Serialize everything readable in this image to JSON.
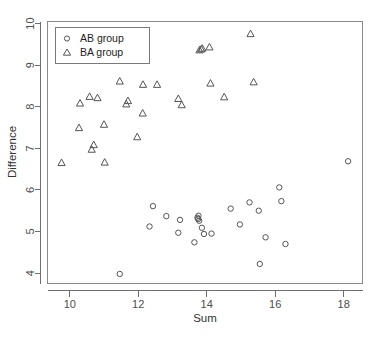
{
  "chart_data": {
    "type": "scatter",
    "title": "",
    "xlabel": "Sum",
    "ylabel": "Difference",
    "xlim": [
      9.35,
      18.55
    ],
    "ylim": [
      3.75,
      10.05
    ],
    "xticks": [
      10,
      12,
      14,
      16,
      18
    ],
    "yticks": [
      4,
      5,
      6,
      7,
      8,
      9,
      10
    ],
    "grid": false,
    "legend_position": "top-left",
    "series": [
      {
        "name": "AB group",
        "marker": "circle",
        "points": [
          [
            11.46,
            3.98
          ],
          [
            12.33,
            5.12
          ],
          [
            12.43,
            5.61
          ],
          [
            12.82,
            5.37
          ],
          [
            13.17,
            4.97
          ],
          [
            13.22,
            5.28
          ],
          [
            13.64,
            4.74
          ],
          [
            13.73,
            5.33
          ],
          [
            13.75,
            5.3
          ],
          [
            13.76,
            5.38
          ],
          [
            13.78,
            5.26
          ],
          [
            13.86,
            5.09
          ],
          [
            13.92,
            4.94
          ],
          [
            14.14,
            4.95
          ],
          [
            14.7,
            5.55
          ],
          [
            14.97,
            5.17
          ],
          [
            15.25,
            5.7
          ],
          [
            15.52,
            5.5
          ],
          [
            15.55,
            4.22
          ],
          [
            15.72,
            4.86
          ],
          [
            16.12,
            6.06
          ],
          [
            16.18,
            5.73
          ],
          [
            16.3,
            4.7
          ],
          [
            18.13,
            6.69
          ]
        ]
      },
      {
        "name": "BA group",
        "marker": "triangle",
        "points": [
          [
            9.76,
            6.65
          ],
          [
            10.27,
            7.49
          ],
          [
            10.3,
            8.08
          ],
          [
            10.58,
            8.24
          ],
          [
            10.64,
            6.97
          ],
          [
            10.7,
            7.08
          ],
          [
            10.81,
            8.21
          ],
          [
            11.0,
            7.57
          ],
          [
            11.02,
            6.66
          ],
          [
            11.46,
            8.61
          ],
          [
            11.65,
            8.06
          ],
          [
            11.7,
            8.14
          ],
          [
            11.97,
            7.27
          ],
          [
            12.13,
            7.84
          ],
          [
            12.14,
            8.53
          ],
          [
            12.55,
            8.53
          ],
          [
            13.17,
            8.19
          ],
          [
            13.27,
            8.04
          ],
          [
            13.79,
            9.36
          ],
          [
            13.84,
            9.38
          ],
          [
            13.87,
            9.4
          ],
          [
            14.08,
            9.43
          ],
          [
            14.11,
            8.56
          ],
          [
            14.51,
            8.23
          ],
          [
            15.28,
            9.75
          ],
          [
            15.37,
            8.59
          ]
        ]
      }
    ]
  },
  "axes": {
    "x_title": "Sum",
    "y_title": "Difference",
    "x_tick_labels": [
      "10",
      "12",
      "14",
      "16",
      "18"
    ],
    "y_tick_labels": [
      "4",
      "5",
      "6",
      "7",
      "8",
      "9",
      "10"
    ]
  },
  "legend": {
    "entries": [
      {
        "label": "AB group",
        "marker": "circle"
      },
      {
        "label": "BA group",
        "marker": "triangle"
      }
    ]
  },
  "colors": {
    "marker_stroke": "#555555",
    "axis": "#6e6e6e",
    "frame": "#8a8a8a",
    "background": "#ffffff",
    "text": "#333333"
  }
}
